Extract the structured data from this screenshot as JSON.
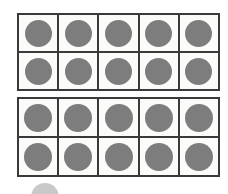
{
  "figure": {
    "type": "ten-frame-counters",
    "background_color": "#ffffff",
    "total_counters_shown": 20,
    "frames": [
      {
        "name": "ten-frame-1",
        "columns": 5,
        "rows": 2,
        "filled_count": 10,
        "cells": [
          [
            {
              "filled": true,
              "counter_label": "counter"
            },
            {
              "filled": true,
              "counter_label": "counter"
            },
            {
              "filled": true,
              "counter_label": "counter"
            },
            {
              "filled": true,
              "counter_label": "counter"
            },
            {
              "filled": true,
              "counter_label": "counter"
            }
          ],
          [
            {
              "filled": true,
              "counter_label": "counter"
            },
            {
              "filled": true,
              "counter_label": "counter"
            },
            {
              "filled": true,
              "counter_label": "counter"
            },
            {
              "filled": true,
              "counter_label": "counter"
            },
            {
              "filled": true,
              "counter_label": "counter"
            }
          ]
        ]
      },
      {
        "name": "ten-frame-2",
        "columns": 5,
        "rows": 2,
        "filled_count": 10,
        "cells": [
          [
            {
              "filled": true,
              "counter_label": "counter"
            },
            {
              "filled": true,
              "counter_label": "counter"
            },
            {
              "filled": true,
              "counter_label": "counter"
            },
            {
              "filled": true,
              "counter_label": "counter"
            },
            {
              "filled": true,
              "counter_label": "counter"
            }
          ],
          [
            {
              "filled": true,
              "counter_label": "counter"
            },
            {
              "filled": true,
              "counter_label": "counter"
            },
            {
              "filled": true,
              "counter_label": "counter"
            },
            {
              "filled": true,
              "counter_label": "counter"
            },
            {
              "filled": true,
              "counter_label": "counter"
            }
          ]
        ]
      }
    ],
    "stray_counter": {
      "name": "partial-counter",
      "visible": true,
      "clipped": true
    },
    "colors": {
      "counter_fill": "#7d7d7d",
      "stray_counter_fill": "#c9c9c9",
      "frame_border": "#3a3a3a",
      "cell_background": "#fbfbf9",
      "page_background": "#ffffff"
    }
  }
}
